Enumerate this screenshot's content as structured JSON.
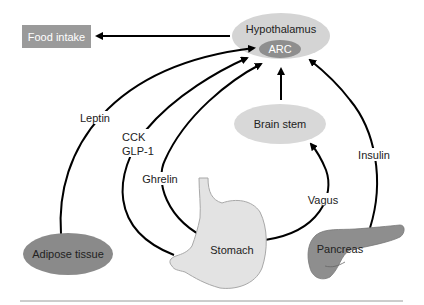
{
  "diagram": {
    "nodes": {
      "food_intake": {
        "label": "Food intake",
        "fill": "#9a9a9a",
        "text_color": "#ffffff"
      },
      "hypothalamus": {
        "label": "Hypothalamus",
        "fill": "#d4d4d4"
      },
      "arc": {
        "label": "ARC",
        "fill": "#8e8e8e",
        "text_color": "#ffffff"
      },
      "brain_stem": {
        "label": "Brain stem",
        "fill": "#d8d8d8"
      },
      "adipose_tissue": {
        "label": "Adipose tissue",
        "fill": "#8a8a8a"
      },
      "stomach": {
        "label": "Stomach",
        "fill": "#e3e3e3"
      },
      "pancreas": {
        "label": "Pancreas",
        "fill": "#8e8e8e"
      }
    },
    "signals": {
      "leptin": "Leptin",
      "cck": "CCK",
      "glp1": "GLP-1",
      "ghrelin": "Ghrelin",
      "vagus": "Vagus",
      "insulin": "Insulin"
    },
    "colors": {
      "arrow": "#000000",
      "rule": "#9a9a9a"
    }
  }
}
